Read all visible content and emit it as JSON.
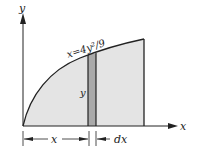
{
  "diagram": {
    "axes": {
      "x_label": "x",
      "y_label": "y"
    },
    "curve": {
      "equation": "x=4y²/9"
    },
    "strip": {
      "height_label": "y",
      "width_label": "dx"
    },
    "dimension": {
      "x_label": "x"
    },
    "colors": {
      "region_fill": "#e4e4e4",
      "strip_fill": "#a9a9a9",
      "stroke": "#222222"
    }
  }
}
